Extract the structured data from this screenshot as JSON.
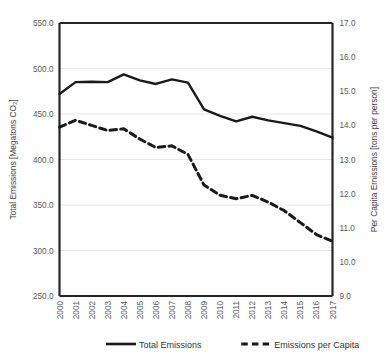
{
  "chart_data": {
    "type": "line",
    "title": "",
    "xlabel": "",
    "grid": true,
    "legend_position": "bottom",
    "categories": [
      "2000",
      "2001",
      "2002",
      "2003",
      "2004",
      "2005",
      "2006",
      "2007",
      "2008",
      "2009",
      "2010",
      "2011",
      "2012",
      "2013",
      "2014",
      "2015",
      "2016",
      "2017"
    ],
    "left_axis": {
      "label": "Total Emissions  [Megatons CO₂]",
      "ylim": [
        250.0,
        550.0
      ],
      "ticks": [
        "250.0",
        "300.0",
        "350.0",
        "400.0",
        "450.0",
        "500.0",
        "550.0"
      ],
      "tick_values": [
        250.0,
        300.0,
        350.0,
        400.0,
        450.0,
        500.0,
        550.0
      ]
    },
    "right_axis": {
      "label": "Per Capita Emissions [tons per person]",
      "ylim": [
        9.0,
        17.0
      ],
      "ticks": [
        "9.0",
        "10.0",
        "11.0",
        "12.0",
        "13.0",
        "14.0",
        "15.0",
        "16.0",
        "17.0"
      ],
      "tick_values": [
        9.0,
        10.0,
        11.0,
        12.0,
        13.0,
        14.0,
        15.0,
        16.0,
        17.0
      ]
    },
    "series": [
      {
        "name": "Total Emissions",
        "axis": "left",
        "style": "solid",
        "color": "#1a1a1a",
        "values": [
          472.0,
          485.0,
          485.5,
          485.0,
          493.5,
          487.0,
          483.0,
          488.0,
          484.5,
          455.0,
          448.0,
          442.0,
          447.0,
          443.0,
          440.0,
          437.0,
          431.0,
          424.0
        ]
      },
      {
        "name": "Emissions per Capita",
        "axis": "right",
        "style": "dashed",
        "color": "#1a1a1a",
        "values": [
          13.95,
          14.15,
          14.0,
          13.85,
          13.9,
          13.6,
          13.35,
          13.4,
          13.15,
          12.25,
          11.95,
          11.85,
          11.95,
          11.75,
          11.5,
          11.15,
          10.8,
          10.6
        ]
      }
    ]
  },
  "legend": {
    "items": [
      {
        "label": "Total Emissions",
        "style": "solid"
      },
      {
        "label": "Emissions per Capita",
        "style": "dashed"
      }
    ]
  }
}
